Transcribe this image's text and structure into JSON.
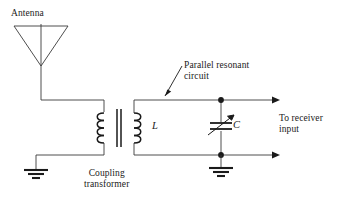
{
  "diagram": {
    "title_labels": {
      "antenna": "Antenna",
      "parallel_resonant": "Parallel resonant\ncircuit",
      "coupling_transformer": "Coupling\ntransformer",
      "to_receiver": "To receiver\ninput",
      "inductor": "L",
      "capacitor": "C"
    },
    "colors": {
      "background": "#ffffff",
      "wire": "#3a3a3a",
      "component": "#1a1a1a",
      "text": "#1a1a1a"
    },
    "components": [
      {
        "name": "antenna",
        "type": "dipole-triangle"
      },
      {
        "name": "coupling-transformer",
        "type": "iron-core-transformer",
        "primary_turns": 4,
        "secondary_turns": 4
      },
      {
        "name": "inductor-L",
        "type": "transformer-secondary-winding",
        "label": "L"
      },
      {
        "name": "variable-capacitor-C",
        "type": "variable-capacitor",
        "label": "C"
      },
      {
        "name": "ground-left",
        "type": "earth-ground"
      },
      {
        "name": "ground-right",
        "type": "earth-ground"
      },
      {
        "name": "output-top",
        "type": "arrow-terminal"
      },
      {
        "name": "output-bottom",
        "type": "arrow-terminal"
      }
    ]
  }
}
